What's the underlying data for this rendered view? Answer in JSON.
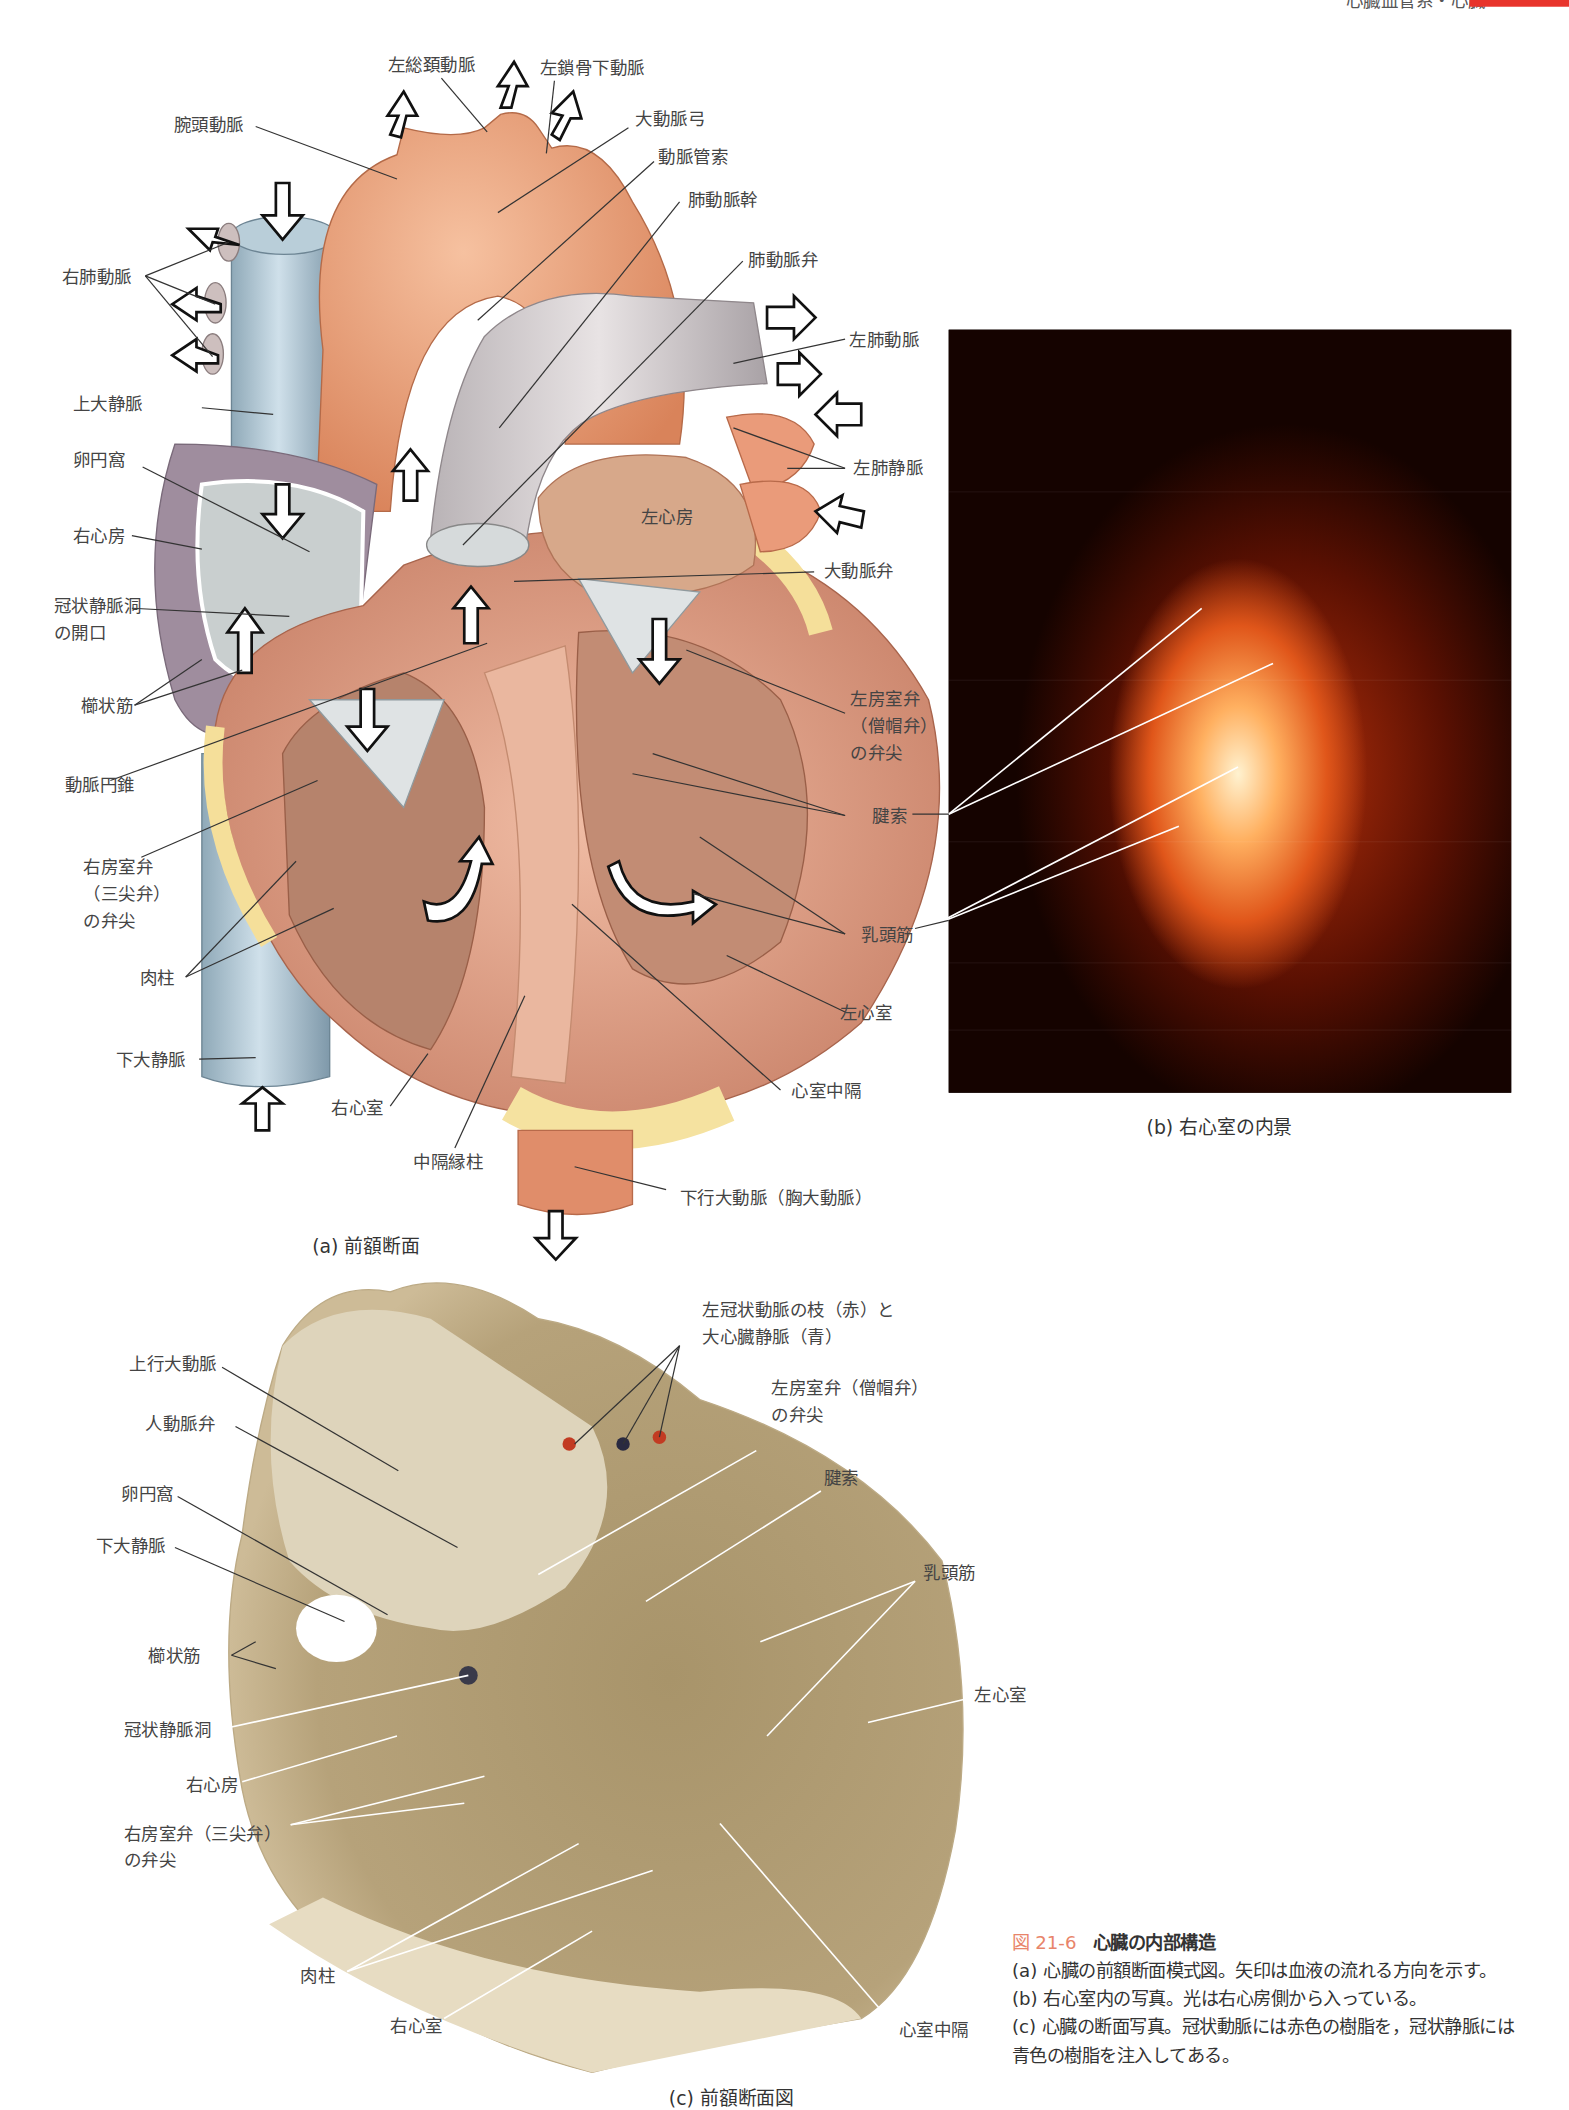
{
  "header": {
    "running_title": "心臓血管系・心臓",
    "tab_color": "#e8342c"
  },
  "figure_a": {
    "caption": "(a) 前額断面",
    "labels": {
      "left_common_carotid": "左総頚動脈",
      "left_subclavian": "左鎖骨下動脈",
      "brachiocephalic": "腕頭動脈",
      "aortic_arch": "大動脈弓",
      "ligamentum_arteriosum": "動脈管索",
      "pulmonary_trunk": "肺動脈幹",
      "pulmonary_valve": "肺動脈弁",
      "right_pulmonary_arteries": "右肺動脈",
      "left_pulmonary_arteries": "左肺動脈",
      "superior_vena_cava": "上大静脈",
      "left_pulmonary_veins": "左肺静脈",
      "fossa_ovalis": "卵円窩",
      "left_atrium": "左心房",
      "right_atrium": "右心房",
      "aortic_valve": "大動脈弁",
      "coronary_sinus_opening": "冠状静脈洞\nの開口",
      "pectinate_muscles": "櫛状筋",
      "mitral_cusp": "左房室弁\n（僧帽弁）\nの弁尖",
      "conus_arteriosus": "動脈円錐",
      "chordae_tendineae": "腱索",
      "tricuspid_cusp": "右房室弁\n（三尖弁）\nの弁尖",
      "papillary_muscles": "乳頭筋",
      "trabeculae_carneae": "肉柱",
      "left_ventricle": "左心室",
      "inferior_vena_cava": "下大静脈",
      "right_ventricle": "右心室",
      "interventricular_septum": "心室中隔",
      "septomarginal_trabecula": "中隔縁柱",
      "descending_aorta": "下行大動脈（胸大動脈）"
    }
  },
  "figure_b": {
    "caption": "(b) 右心室の内景"
  },
  "figure_c": {
    "caption": "(c) 前額断面図",
    "labels": {
      "coronary_vessels": "左冠状動脈の枝（赤）と\n大心臓静脈（青）",
      "ascending_aorta": "上行大動脈",
      "aortic_valve": "人動脈弁",
      "mitral_cusp": "左房室弁（僧帽弁）\nの弁尖",
      "fossa_ovalis": "卵円窩",
      "chordae_tendineae": "腱索",
      "inferior_vena_cava": "下大静脈",
      "papillary_muscles": "乳頭筋",
      "pectinate_muscles": "櫛状筋",
      "left_ventricle": "左心室",
      "coronary_sinus": "冠状静脈洞",
      "right_atrium": "右心房",
      "tricuspid_cusp": "右房室弁（三尖弁）\nの弁尖",
      "trabeculae_carneae": "肉柱",
      "right_ventricle": "右心室",
      "interventricular_septum": "心室中隔"
    }
  },
  "figure_caption": {
    "number": "図 21-6",
    "title": "心臓の内部構造",
    "number_color": "#e8846a",
    "lines": [
      "(a) 心臓の前額断面模式図。矢印は血液の流れる方向を示す。",
      "(b) 右心室内の写真。光は右心房側から入っている。",
      "(c) 心臓の断面写真。冠状動脈には赤色の樹脂を，冠状静脈には青色の樹脂を注入してある。"
    ]
  }
}
